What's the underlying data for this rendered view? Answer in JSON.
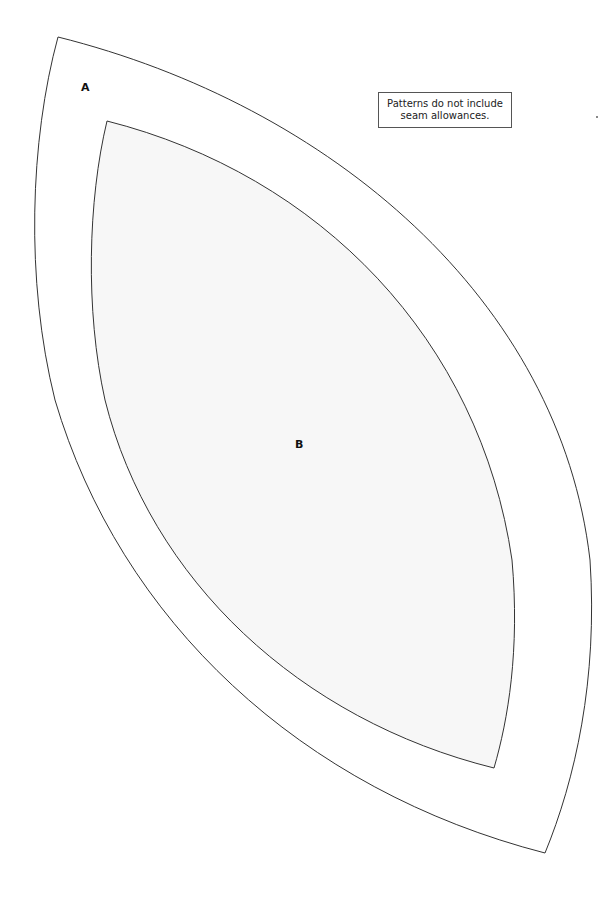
{
  "pattern": {
    "outer_piece": {
      "label": "A",
      "stroke": "#333333",
      "fill": "#ffffff"
    },
    "inner_piece": {
      "label": "B",
      "stroke": "#333333",
      "fill": "#f7f7f7"
    },
    "note": {
      "line1": "Patterns do not include",
      "line2": "seam allowances."
    }
  }
}
